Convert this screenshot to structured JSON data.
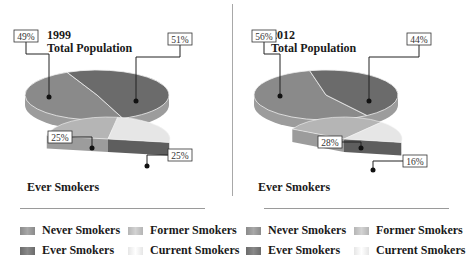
{
  "colors": {
    "never": "#8a8a8a",
    "ever": "#6b6b6b",
    "former": "#b5b5b5",
    "current": "#e6e6e6",
    "side_dark": "#5e5e5e",
    "side_light": "#9c9c9c"
  },
  "legend": {
    "items": [
      {
        "key": "never",
        "label": "Never Smokers"
      },
      {
        "key": "former",
        "label": "Former Smokers"
      },
      {
        "key": "ever",
        "label": "Ever Smokers"
      },
      {
        "key": "current",
        "label": "Current Smokers"
      }
    ]
  },
  "chart_data": [
    {
      "type": "pie",
      "title": "1999",
      "subtitle": "Total Population",
      "slices": [
        {
          "name": "Never Smokers",
          "key": "never",
          "value": 49,
          "label": "49%"
        },
        {
          "name": "Ever Smokers",
          "key": "ever",
          "value": 51,
          "label": "51%"
        }
      ],
      "breakdown": {
        "title": "Ever Smokers",
        "slices": [
          {
            "name": "Former Smokers",
            "key": "former",
            "value": 25,
            "label": "25%"
          },
          {
            "name": "Current Smokers",
            "key": "current",
            "value": 25,
            "label": "25%"
          }
        ]
      },
      "legend_position": "bottom"
    },
    {
      "type": "pie",
      "title": "2012",
      "subtitle": "Total Population",
      "slices": [
        {
          "name": "Never Smokers",
          "key": "never",
          "value": 56,
          "label": "56%"
        },
        {
          "name": "Ever Smokers",
          "key": "ever",
          "value": 44,
          "label": "44%"
        }
      ],
      "breakdown": {
        "title": "Ever Smokers",
        "slices": [
          {
            "name": "Former Smokers",
            "key": "former",
            "value": 28,
            "label": "28%"
          },
          {
            "name": "Current Smokers",
            "key": "current",
            "value": 16,
            "label": "16%"
          }
        ]
      },
      "legend_position": "bottom"
    }
  ]
}
